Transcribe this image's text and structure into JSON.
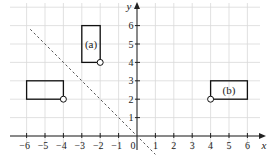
{
  "chart_data": {
    "type": "diagram",
    "title": "",
    "xlabel": "x",
    "ylabel": "y",
    "xlim": [
      -6.5,
      6.5
    ],
    "ylim": [
      -0.6,
      6.9
    ],
    "grid": true,
    "x_ticks": [
      -6,
      -5,
      -4,
      -3,
      -2,
      -1,
      0,
      1,
      2,
      3,
      4,
      5,
      6
    ],
    "x_tick_labels": [
      "−6",
      "−5",
      "−4",
      "−3",
      "−2",
      "−1",
      "0",
      "1",
      "2",
      "3",
      "4",
      "5",
      "6"
    ],
    "y_ticks": [
      1,
      2,
      3,
      4,
      5,
      6
    ],
    "y_tick_labels": [
      "1",
      "2",
      "3",
      "4",
      "5",
      "6"
    ],
    "shapes": [
      {
        "name": "original-rectangle",
        "label": "",
        "x1": -6,
        "y1": 2,
        "x2": -4,
        "y2": 3,
        "marker": [
          -4,
          2
        ]
      },
      {
        "name": "rectangle-a",
        "label": "(a)",
        "x1": -3,
        "y1": 4,
        "x2": -2,
        "y2": 6,
        "marker": [
          -2,
          4
        ]
      },
      {
        "name": "rectangle-b",
        "label": "(b)",
        "x1": 4,
        "y1": 2,
        "x2": 6,
        "y2": 3,
        "marker": [
          4,
          2
        ]
      }
    ],
    "dashed_line": {
      "equation": "y = -x",
      "from": [
        -5.8,
        5.8
      ],
      "to": [
        1,
        -1
      ]
    }
  },
  "colors": {
    "grid": "#d9d9d9",
    "axis": "#222222",
    "shape": "#111111",
    "dashed": "#555555"
  }
}
